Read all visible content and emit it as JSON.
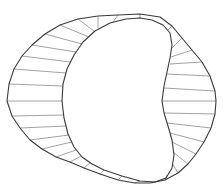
{
  "diagram": {
    "colors": {
      "background": "#ffffff",
      "curve": "#3a3a3a",
      "connector": "#8a8a8a"
    },
    "outer_curve": [
      [
        7,
        101
      ],
      [
        9,
        84
      ],
      [
        14,
        69
      ],
      [
        22,
        56
      ],
      [
        32,
        45
      ],
      [
        45,
        34
      ],
      [
        60,
        25
      ],
      [
        78,
        19
      ],
      [
        98,
        16
      ],
      [
        118,
        15
      ],
      [
        140,
        14
      ],
      [
        160,
        17
      ],
      [
        172,
        26
      ],
      [
        182,
        38
      ],
      [
        192,
        50
      ],
      [
        202,
        62
      ],
      [
        210,
        76
      ],
      [
        215,
        91
      ],
      [
        216,
        101
      ],
      [
        215,
        114
      ],
      [
        211,
        128
      ],
      [
        204,
        142
      ],
      [
        196,
        154
      ],
      [
        188,
        164
      ],
      [
        178,
        173
      ],
      [
        165,
        180
      ],
      [
        150,
        183
      ],
      [
        135,
        183
      ],
      [
        118,
        180
      ],
      [
        100,
        174
      ],
      [
        84,
        168
      ],
      [
        70,
        162
      ],
      [
        56,
        157
      ],
      [
        42,
        149
      ],
      [
        30,
        140
      ],
      [
        20,
        128
      ],
      [
        12,
        116
      ],
      [
        7,
        101
      ]
    ],
    "inner_curve": [
      [
        62,
        101
      ],
      [
        63,
        84
      ],
      [
        67,
        69
      ],
      [
        74,
        55
      ],
      [
        83,
        42
      ],
      [
        95,
        31
      ],
      [
        110,
        23
      ],
      [
        126,
        19
      ],
      [
        140,
        18
      ],
      [
        152,
        20
      ],
      [
        163,
        25
      ],
      [
        170,
        33
      ],
      [
        172,
        45
      ],
      [
        170,
        58
      ],
      [
        167,
        72
      ],
      [
        164,
        86
      ],
      [
        162,
        101
      ],
      [
        164,
        113
      ],
      [
        168,
        126
      ],
      [
        172,
        140
      ],
      [
        174,
        155
      ],
      [
        172,
        168
      ],
      [
        166,
        178
      ],
      [
        155,
        182
      ],
      [
        140,
        181
      ],
      [
        122,
        176
      ],
      [
        104,
        170
      ],
      [
        92,
        164
      ],
      [
        82,
        157
      ],
      [
        74,
        147
      ],
      [
        68,
        134
      ],
      [
        64,
        118
      ],
      [
        62,
        101
      ]
    ],
    "connectors": [
      [
        [
          7,
          101
        ],
        [
          62,
          101
        ]
      ],
      [
        [
          9,
          84
        ],
        [
          63,
          86
        ]
      ],
      [
        [
          14,
          69
        ],
        [
          66,
          73
        ]
      ],
      [
        [
          22,
          56
        ],
        [
          70,
          62
        ]
      ],
      [
        [
          32,
          45
        ],
        [
          76,
          52
        ]
      ],
      [
        [
          45,
          34
        ],
        [
          82,
          44
        ]
      ],
      [
        [
          60,
          25
        ],
        [
          89,
          37
        ]
      ],
      [
        [
          78,
          19
        ],
        [
          94,
          31
        ]
      ],
      [
        [
          98,
          16
        ],
        [
          98,
          28
        ]
      ],
      [
        [
          118,
          15
        ],
        [
          113,
          22
        ]
      ],
      [
        [
          140,
          14
        ],
        [
          140,
          18
        ]
      ],
      [
        [
          172,
          26
        ],
        [
          168,
          30
        ]
      ],
      [
        [
          182,
          38
        ],
        [
          172,
          48
        ]
      ],
      [
        [
          192,
          50
        ],
        [
          171,
          57
        ]
      ],
      [
        [
          202,
          62
        ],
        [
          170,
          64
        ]
      ],
      [
        [
          210,
          76
        ],
        [
          167,
          74
        ]
      ],
      [
        [
          215,
          91
        ],
        [
          164,
          88
        ]
      ],
      [
        [
          216,
          101
        ],
        [
          162,
          101
        ]
      ],
      [
        [
          215,
          114
        ],
        [
          164,
          113
        ]
      ],
      [
        [
          211,
          128
        ],
        [
          167,
          123
        ]
      ],
      [
        [
          204,
          142
        ],
        [
          170,
          133
        ]
      ],
      [
        [
          196,
          154
        ],
        [
          172,
          142
        ]
      ],
      [
        [
          188,
          164
        ],
        [
          173,
          152
        ]
      ],
      [
        [
          178,
          173
        ],
        [
          172,
          163
        ]
      ],
      [
        [
          165,
          180
        ],
        [
          167,
          175
        ]
      ],
      [
        [
          135,
          183
        ],
        [
          140,
          181
        ]
      ],
      [
        [
          118,
          180
        ],
        [
          122,
          176
        ]
      ],
      [
        [
          100,
          174
        ],
        [
          104,
          170
        ]
      ],
      [
        [
          84,
          168
        ],
        [
          90,
          163
        ]
      ],
      [
        [
          70,
          162
        ],
        [
          81,
          156
        ]
      ],
      [
        [
          56,
          157
        ],
        [
          76,
          150
        ]
      ],
      [
        [
          42,
          149
        ],
        [
          72,
          142
        ]
      ],
      [
        [
          30,
          140
        ],
        [
          69,
          135
        ]
      ],
      [
        [
          20,
          128
        ],
        [
          66,
          126
        ]
      ],
      [
        [
          12,
          116
        ],
        [
          64,
          115
        ]
      ]
    ]
  }
}
